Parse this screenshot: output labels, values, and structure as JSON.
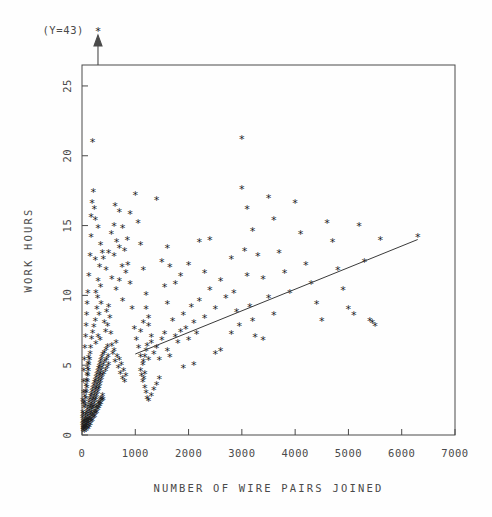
{
  "chart_data": {
    "type": "scatter",
    "title": "",
    "xlabel": "NUMBER OF WIRE PAIRS JOINED",
    "ylabel": "WORK HOURS",
    "xlim": [
      0,
      7000
    ],
    "ylim": [
      0,
      26.5
    ],
    "xticks": [
      0,
      1000,
      2000,
      3000,
      4000,
      5000,
      6000,
      7000
    ],
    "yticks": [
      0,
      5,
      10,
      15,
      20,
      25
    ],
    "xticklabels": [
      "0",
      "1000",
      "2000",
      "3000",
      "4000",
      "5000",
      "6000",
      "7000"
    ],
    "yticklabels": [
      "0",
      "5",
      "10",
      "15",
      "20",
      "25"
    ],
    "grid": false,
    "legend": null,
    "marker": "*",
    "marker_color": "#1d1d1d",
    "annotations": [
      {
        "text": "(Y=43)",
        "x": 300,
        "y": 43,
        "kind": "offscale-outlier-arrow",
        "arrow_x": 300,
        "note": "single point above axis range, marked with arrow at top frame"
      }
    ],
    "fit_line": {
      "kind": "regression-line",
      "x_start": 1000,
      "y_start": 5.8,
      "x_end": 6300,
      "y_end": 14.0,
      "color": "#3a3a3a"
    },
    "points": [
      [
        20,
        0.3
      ],
      [
        25,
        0.5
      ],
      [
        30,
        0.4
      ],
      [
        35,
        0.8
      ],
      [
        40,
        0.6
      ],
      [
        45,
        1.0
      ],
      [
        50,
        0.5
      ],
      [
        55,
        0.9
      ],
      [
        60,
        1.2
      ],
      [
        65,
        0.7
      ],
      [
        70,
        1.4
      ],
      [
        75,
        1.0
      ],
      [
        80,
        0.6
      ],
      [
        85,
        1.6
      ],
      [
        90,
        1.1
      ],
      [
        95,
        0.8
      ],
      [
        100,
        1.8
      ],
      [
        105,
        1.3
      ],
      [
        110,
        0.9
      ],
      [
        115,
        2.0
      ],
      [
        120,
        1.5
      ],
      [
        125,
        1.1
      ],
      [
        130,
        2.3
      ],
      [
        135,
        1.7
      ],
      [
        140,
        1.2
      ],
      [
        145,
        2.5
      ],
      [
        150,
        1.9
      ],
      [
        155,
        1.4
      ],
      [
        160,
        2.7
      ],
      [
        165,
        2.1
      ],
      [
        170,
        1.6
      ],
      [
        175,
        2.9
      ],
      [
        180,
        2.2
      ],
      [
        185,
        1.8
      ],
      [
        190,
        3.1
      ],
      [
        195,
        2.4
      ],
      [
        200,
        1.9
      ],
      [
        205,
        3.3
      ],
      [
        210,
        2.6
      ],
      [
        215,
        2.0
      ],
      [
        220,
        3.5
      ],
      [
        225,
        2.8
      ],
      [
        230,
        2.2
      ],
      [
        235,
        3.7
      ],
      [
        240,
        3.0
      ],
      [
        245,
        2.4
      ],
      [
        250,
        3.9
      ],
      [
        255,
        3.2
      ],
      [
        260,
        2.6
      ],
      [
        265,
        4.1
      ],
      [
        270,
        3.4
      ],
      [
        275,
        2.8
      ],
      [
        280,
        4.3
      ],
      [
        285,
        3.6
      ],
      [
        290,
        3.0
      ],
      [
        295,
        4.5
      ],
      [
        300,
        3.8
      ],
      [
        305,
        3.2
      ],
      [
        310,
        4.7
      ],
      [
        315,
        4.0
      ],
      [
        320,
        3.4
      ],
      [
        325,
        4.9
      ],
      [
        330,
        4.2
      ],
      [
        335,
        3.6
      ],
      [
        340,
        5.1
      ],
      [
        345,
        4.4
      ],
      [
        350,
        3.8
      ],
      [
        355,
        5.3
      ],
      [
        360,
        4.6
      ],
      [
        365,
        4.0
      ],
      [
        370,
        5.5
      ],
      [
        375,
        4.8
      ],
      [
        380,
        4.2
      ],
      [
        390,
        5.7
      ],
      [
        400,
        5.0
      ],
      [
        410,
        4.4
      ],
      [
        420,
        5.9
      ],
      [
        430,
        5.2
      ],
      [
        440,
        4.6
      ],
      [
        450,
        6.1
      ],
      [
        460,
        5.4
      ],
      [
        470,
        4.8
      ],
      [
        480,
        6.3
      ],
      [
        490,
        5.6
      ],
      [
        500,
        5.0
      ],
      [
        60,
        2.1
      ],
      [
        70,
        2.6
      ],
      [
        80,
        3.0
      ],
      [
        90,
        3.4
      ],
      [
        100,
        3.8
      ],
      [
        110,
        4.2
      ],
      [
        120,
        4.6
      ],
      [
        130,
        5.0
      ],
      [
        140,
        5.4
      ],
      [
        150,
        5.8
      ],
      [
        160,
        6.2
      ],
      [
        40,
        1.9
      ],
      [
        50,
        2.3
      ],
      [
        55,
        2.7
      ],
      [
        65,
        3.1
      ],
      [
        75,
        3.5
      ],
      [
        85,
        3.9
      ],
      [
        95,
        4.3
      ],
      [
        105,
        4.7
      ],
      [
        115,
        5.1
      ],
      [
        125,
        5.5
      ],
      [
        45,
        0.2
      ],
      [
        55,
        0.4
      ],
      [
        65,
        0.6
      ],
      [
        75,
        0.3
      ],
      [
        85,
        0.7
      ],
      [
        95,
        0.5
      ],
      [
        105,
        0.9
      ],
      [
        115,
        0.4
      ],
      [
        125,
        0.8
      ],
      [
        135,
        0.6
      ],
      [
        145,
        1.0
      ],
      [
        155,
        0.7
      ],
      [
        165,
        1.1
      ],
      [
        175,
        0.9
      ],
      [
        185,
        1.3
      ],
      [
        195,
        1.0
      ],
      [
        205,
        1.4
      ],
      [
        215,
        1.2
      ],
      [
        225,
        1.6
      ],
      [
        235,
        1.3
      ],
      [
        245,
        1.7
      ],
      [
        255,
        1.5
      ],
      [
        265,
        1.9
      ],
      [
        275,
        1.6
      ],
      [
        285,
        2.0
      ],
      [
        295,
        1.8
      ],
      [
        305,
        2.2
      ],
      [
        315,
        1.9
      ],
      [
        325,
        2.3
      ],
      [
        335,
        2.1
      ],
      [
        345,
        2.5
      ],
      [
        355,
        2.2
      ],
      [
        365,
        2.6
      ],
      [
        375,
        2.4
      ],
      [
        385,
        2.8
      ],
      [
        395,
        2.5
      ],
      [
        180,
        6.9
      ],
      [
        200,
        7.3
      ],
      [
        220,
        7.7
      ],
      [
        250,
        8.2
      ],
      [
        260,
        6.5
      ],
      [
        280,
        9.0
      ],
      [
        300,
        7.0
      ],
      [
        320,
        8.6
      ],
      [
        340,
        6.8
      ],
      [
        360,
        9.4
      ],
      [
        200,
        21.0
      ],
      [
        380,
        13.0
      ],
      [
        250,
        12.5
      ],
      [
        300,
        11.0
      ],
      [
        330,
        12.0
      ],
      [
        170,
        14.2
      ],
      [
        260,
        10.2
      ],
      [
        290,
        9.8
      ],
      [
        350,
        10.6
      ],
      [
        420,
        8.0
      ],
      [
        440,
        7.4
      ],
      [
        460,
        8.8
      ],
      [
        480,
        7.8
      ],
      [
        500,
        9.2
      ],
      [
        520,
        8.4
      ],
      [
        540,
        7.2
      ],
      [
        560,
        6.4
      ],
      [
        580,
        5.8
      ],
      [
        600,
        6.0
      ],
      [
        620,
        5.2
      ],
      [
        640,
        6.6
      ],
      [
        660,
        5.6
      ],
      [
        680,
        4.8
      ],
      [
        700,
        5.4
      ],
      [
        720,
        4.4
      ],
      [
        740,
        5.0
      ],
      [
        760,
        4.0
      ],
      [
        780,
        4.6
      ],
      [
        800,
        3.8
      ],
      [
        820,
        4.2
      ],
      [
        560,
        11.2
      ],
      [
        600,
        12.8
      ],
      [
        640,
        10.4
      ],
      [
        700,
        13.4
      ],
      [
        760,
        9.6
      ],
      [
        820,
        11.6
      ],
      [
        620,
        16.4
      ],
      [
        700,
        16.0
      ],
      [
        760,
        14.8
      ],
      [
        860,
        12.2
      ],
      [
        900,
        10.8
      ],
      [
        940,
        9.0
      ],
      [
        980,
        7.6
      ],
      [
        1020,
        6.8
      ],
      [
        1060,
        6.2
      ],
      [
        1100,
        5.6
      ],
      [
        1140,
        5.0
      ],
      [
        1180,
        4.4
      ],
      [
        1000,
        17.2
      ],
      [
        1050,
        15.2
      ],
      [
        1100,
        13.6
      ],
      [
        1150,
        11.8
      ],
      [
        1200,
        10.0
      ],
      [
        1250,
        8.4
      ],
      [
        1300,
        7.0
      ],
      [
        1150,
        5.2
      ],
      [
        1180,
        5.6
      ],
      [
        1200,
        6.0
      ],
      [
        1220,
        6.4
      ],
      [
        1250,
        5.4
      ],
      [
        1100,
        4.6
      ],
      [
        1120,
        4.2
      ],
      [
        1140,
        3.8
      ],
      [
        1160,
        4.0
      ],
      [
        1180,
        3.4
      ],
      [
        1200,
        3.0
      ],
      [
        1220,
        2.6
      ],
      [
        1250,
        2.4
      ],
      [
        1300,
        2.8
      ],
      [
        1350,
        3.2
      ],
      [
        1400,
        3.6
      ],
      [
        1450,
        4.0
      ],
      [
        1100,
        7.4
      ],
      [
        1150,
        8.0
      ],
      [
        1200,
        9.0
      ],
      [
        1250,
        7.8
      ],
      [
        1300,
        6.6
      ],
      [
        1350,
        5.8
      ],
      [
        1400,
        6.2
      ],
      [
        1450,
        5.4
      ],
      [
        1500,
        6.8
      ],
      [
        1550,
        7.2
      ],
      [
        1600,
        6.0
      ],
      [
        1650,
        5.6
      ],
      [
        1400,
        16.8
      ],
      [
        1500,
        12.4
      ],
      [
        1550,
        10.6
      ],
      [
        1600,
        9.4
      ],
      [
        1700,
        8.2
      ],
      [
        1750,
        7.0
      ],
      [
        1800,
        6.6
      ],
      [
        1850,
        7.4
      ],
      [
        1900,
        8.6
      ],
      [
        1950,
        7.6
      ],
      [
        2000,
        6.8
      ],
      [
        2050,
        9.2
      ],
      [
        2100,
        8.0
      ],
      [
        2150,
        7.2
      ],
      [
        2200,
        9.6
      ],
      [
        2300,
        8.4
      ],
      [
        2400,
        10.4
      ],
      [
        2500,
        9.0
      ],
      [
        2600,
        11.0
      ],
      [
        2700,
        9.8
      ],
      [
        2800,
        12.6
      ],
      [
        2850,
        10.2
      ],
      [
        2900,
        8.8
      ],
      [
        2950,
        7.8
      ],
      [
        3000,
        21.2
      ],
      [
        3050,
        13.2
      ],
      [
        3100,
        11.4
      ],
      [
        3150,
        9.2
      ],
      [
        3200,
        8.2
      ],
      [
        3250,
        7.0
      ],
      [
        3000,
        17.6
      ],
      [
        3100,
        16.2
      ],
      [
        3200,
        14.6
      ],
      [
        3300,
        12.8
      ],
      [
        3400,
        11.2
      ],
      [
        3500,
        9.8
      ],
      [
        3600,
        8.6
      ],
      [
        3500,
        17.0
      ],
      [
        3600,
        15.4
      ],
      [
        3700,
        13.0
      ],
      [
        3800,
        11.6
      ],
      [
        3900,
        10.2
      ],
      [
        4000,
        16.6
      ],
      [
        4100,
        14.4
      ],
      [
        4200,
        12.2
      ],
      [
        4300,
        10.8
      ],
      [
        4400,
        9.4
      ],
      [
        4500,
        8.2
      ],
      [
        4600,
        15.2
      ],
      [
        4700,
        13.8
      ],
      [
        4800,
        11.8
      ],
      [
        4900,
        10.4
      ],
      [
        5000,
        9.0
      ],
      [
        5100,
        8.6
      ],
      [
        5200,
        15.0
      ],
      [
        5300,
        12.4
      ],
      [
        5400,
        8.2
      ],
      [
        5450,
        8.0
      ],
      [
        5500,
        7.8
      ],
      [
        5600,
        14.0
      ],
      [
        6300,
        14.2
      ],
      [
        2800,
        7.2
      ],
      [
        3400,
        6.8
      ],
      [
        2500,
        5.8
      ],
      [
        1900,
        4.8
      ],
      [
        2100,
        5.0
      ],
      [
        1750,
        10.8
      ],
      [
        1650,
        12.0
      ],
      [
        1600,
        13.4
      ],
      [
        2200,
        13.8
      ],
      [
        2400,
        14.0
      ],
      [
        2600,
        6.0
      ],
      [
        1850,
        11.4
      ],
      [
        2000,
        12.2
      ],
      [
        2300,
        11.6
      ],
      [
        900,
        15.8
      ],
      [
        850,
        14.0
      ],
      [
        800,
        13.2
      ],
      [
        750,
        12.0
      ],
      [
        700,
        11.0
      ],
      [
        650,
        13.8
      ],
      [
        600,
        15.0
      ],
      [
        550,
        14.4
      ],
      [
        500,
        13.0
      ],
      [
        450,
        11.8
      ],
      [
        400,
        12.6
      ],
      [
        350,
        13.6
      ],
      [
        300,
        14.8
      ],
      [
        250,
        15.4
      ],
      [
        230,
        16.2
      ],
      [
        210,
        17.4
      ],
      [
        190,
        16.6
      ],
      [
        170,
        15.6
      ],
      [
        150,
        12.8
      ],
      [
        130,
        11.4
      ],
      [
        110,
        10.2
      ],
      [
        95,
        9.4
      ],
      [
        85,
        8.6
      ],
      [
        75,
        7.8
      ],
      [
        65,
        7.0
      ],
      [
        55,
        6.2
      ],
      [
        45,
        5.4
      ],
      [
        35,
        4.6
      ],
      [
        30,
        3.8
      ],
      [
        28,
        3.0
      ],
      [
        26,
        2.2
      ],
      [
        24,
        1.4
      ],
      [
        22,
        0.9
      ],
      [
        18,
        0.4
      ],
      [
        16,
        1.6
      ],
      [
        14,
        2.4
      ],
      [
        12,
        0.7
      ],
      [
        10,
        1.2
      ]
    ]
  },
  "axis": {
    "y_title": "WORK HOURS",
    "x_title": "NUMBER OF WIRE PAIRS JOINED"
  },
  "outlier_note": {
    "label": "(Y=43)",
    "marker": "*"
  }
}
